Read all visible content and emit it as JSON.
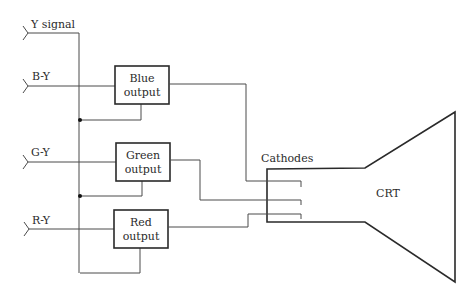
{
  "diagram": {
    "inputs": [
      {
        "id": "y",
        "label": "Y signal"
      },
      {
        "id": "b",
        "label": "B-Y"
      },
      {
        "id": "g",
        "label": "G-Y"
      },
      {
        "id": "r",
        "label": "R-Y"
      }
    ],
    "blocks": [
      {
        "id": "blue",
        "line1": "Blue",
        "line2": "output"
      },
      {
        "id": "green",
        "line1": "Green",
        "line2": "output"
      },
      {
        "id": "red",
        "line1": "Red",
        "line2": "output"
      }
    ],
    "cathodes_label": "Cathodes",
    "crt_label": "CRT",
    "colors": {
      "line": "#4a4a4a",
      "box": "#2a2a2a",
      "text": "#2b2b2b",
      "background": "#ffffff"
    }
  }
}
